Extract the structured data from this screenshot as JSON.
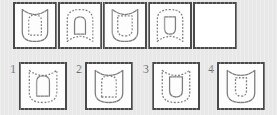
{
  "puzzle": {
    "type": "visual-analogy-matrix",
    "title": "Shape sequence puzzle",
    "background_color": "#e8e8e8",
    "cell_fill_color": "#fdfdfd",
    "cell_border_color": "#4a4a4a",
    "figure_stroke_color": "#7d7d7d"
  },
  "stem": {
    "cell_count": 5,
    "cells": [
      {
        "index": 1,
        "name": "stem-cell-1",
        "outer": {
          "shape": "shield-notched-top",
          "style": "solid",
          "orientation": "concave-top-round-bottom",
          "size": "large"
        },
        "inner": {
          "shape": "arch-tall",
          "style": "dashed",
          "orientation": "round-top-flat-bottom",
          "size": "medium"
        },
        "empty": false
      },
      {
        "index": 2,
        "name": "stem-cell-2",
        "outer": {
          "shape": "shield-notched-bottom",
          "style": "dashed",
          "orientation": "round-top-concave-bottom",
          "size": "large"
        },
        "inner": {
          "shape": "arch-tall",
          "style": "solid",
          "orientation": "round-top-flat-bottom",
          "size": "small"
        },
        "empty": false
      },
      {
        "index": 3,
        "name": "stem-cell-3",
        "outer": {
          "shape": "shield-notched-top",
          "style": "solid",
          "orientation": "concave-top-round-bottom",
          "size": "large"
        },
        "inner": {
          "shape": "u-wide",
          "style": "dashed",
          "orientation": "flat-top-round-bottom",
          "size": "medium"
        },
        "empty": false
      },
      {
        "index": 4,
        "name": "stem-cell-4",
        "outer": {
          "shape": "shield-notched-bottom",
          "style": "dashed",
          "orientation": "round-top-concave-bottom",
          "size": "large"
        },
        "inner": {
          "shape": "u-narrow",
          "style": "solid",
          "orientation": "flat-top-round-bottom",
          "size": "small"
        },
        "empty": false
      },
      {
        "index": 5,
        "name": "stem-cell-5-answer-blank",
        "outer": null,
        "inner": null,
        "empty": true
      }
    ]
  },
  "options": {
    "count": 4,
    "items": [
      {
        "number": "1",
        "name": "option-1",
        "outer": {
          "shape": "shield-notched-top",
          "style": "dashed",
          "orientation": "concave-top-round-bottom",
          "size": "large"
        },
        "inner": {
          "shape": "arch-tall",
          "style": "solid",
          "orientation": "round-top-flat-bottom",
          "size": "medium"
        }
      },
      {
        "number": "2",
        "name": "option-2",
        "outer": {
          "shape": "shield-notched-top",
          "style": "solid",
          "orientation": "concave-top-round-bottom",
          "size": "large"
        },
        "inner": {
          "shape": "arch-tall",
          "style": "dashed",
          "orientation": "round-top-flat-bottom",
          "size": "medium"
        }
      },
      {
        "number": "3",
        "name": "option-3",
        "outer": {
          "shape": "shield-notched-top",
          "style": "dashed",
          "orientation": "concave-top-round-bottom",
          "size": "large"
        },
        "inner": {
          "shape": "u-narrow",
          "style": "solid",
          "orientation": "flat-top-round-bottom",
          "size": "medium"
        }
      },
      {
        "number": "4",
        "name": "option-4",
        "outer": {
          "shape": "shield-notched-top",
          "style": "solid",
          "orientation": "concave-top-round-bottom",
          "size": "large"
        },
        "inner": {
          "shape": "u-narrow",
          "style": "dashed",
          "orientation": "flat-top-round-bottom",
          "size": "medium"
        }
      }
    ]
  }
}
